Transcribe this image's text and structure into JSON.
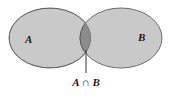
{
  "diagram": {
    "type": "venn",
    "sets": [
      {
        "label": "A",
        "color": "#c8c8c8"
      },
      {
        "label": "B",
        "color": "#c8c8c8"
      }
    ],
    "intersection": {
      "label": "A ∩ B",
      "color": "#8a8a8a"
    },
    "stroke_color": "#6a6a6a"
  }
}
